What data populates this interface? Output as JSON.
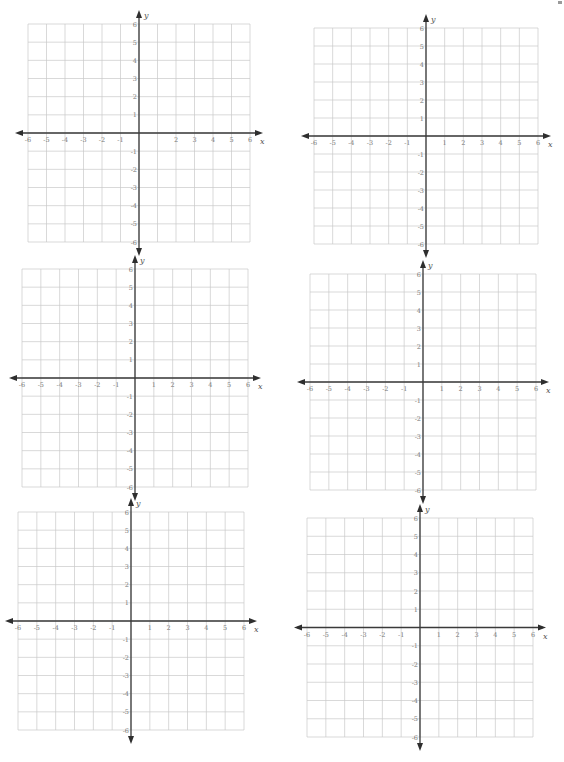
{
  "page": {
    "background": "#ffffff",
    "grid_color": "#c9c9c9",
    "axis_color": "#3a3a3a",
    "label_color": "#7a7a7a"
  },
  "planes": [
    {
      "id": "plane-1",
      "position": "top-left",
      "grid_box": {
        "left": 28,
        "top": 24,
        "width": 222,
        "height": 218
      },
      "x_axis_label": "x",
      "y_axis_label": "y",
      "x_range": [
        -6,
        6
      ],
      "y_range": [
        -6,
        6
      ],
      "x_tick_labels": [
        "-6",
        "-5",
        "-4",
        "-3",
        "-2",
        "-1",
        "",
        "2",
        "3",
        "4",
        "5",
        "6"
      ],
      "y_tick_labels": [
        "6",
        "5",
        "4",
        "3",
        "2",
        "1",
        "-1",
        "-2",
        "-3",
        "-4",
        "-5",
        "-6"
      ]
    },
    {
      "id": "plane-2",
      "position": "top-right",
      "grid_box": {
        "left": 314,
        "top": 28,
        "width": 224,
        "height": 216
      },
      "x_axis_label": "x",
      "y_axis_label": "y",
      "x_range": [
        -6,
        6
      ],
      "y_range": [
        -6,
        6
      ],
      "x_tick_labels": [
        "-6",
        "-5",
        "-4",
        "-3",
        "-2",
        "-1",
        "1",
        "2",
        "3",
        "4",
        "5",
        "6"
      ],
      "y_tick_labels": [
        "6",
        "5",
        "4",
        "3",
        "2",
        "1",
        "-1",
        "-2",
        "-3",
        "-4",
        "-5",
        "-6"
      ]
    },
    {
      "id": "plane-3",
      "position": "middle-left",
      "grid_box": {
        "left": 22,
        "top": 269,
        "width": 226,
        "height": 218
      },
      "x_axis_label": "x",
      "y_axis_label": "y",
      "x_range": [
        -6,
        6
      ],
      "y_range": [
        -6,
        6
      ],
      "x_tick_labels": [
        "-6",
        "-5",
        "-4",
        "-3",
        "-2",
        "-1",
        "1",
        "2",
        "3",
        "4",
        "5",
        "6"
      ],
      "y_tick_labels": [
        "6",
        "5",
        "4",
        "3",
        "2",
        "1",
        "-1",
        "-2",
        "-3",
        "-4",
        "-5",
        "-6"
      ]
    },
    {
      "id": "plane-4",
      "position": "middle-right",
      "grid_box": {
        "left": 310,
        "top": 274,
        "width": 226,
        "height": 216
      },
      "x_axis_label": "x",
      "y_axis_label": "y",
      "x_range": [
        -6,
        6
      ],
      "y_range": [
        -6,
        6
      ],
      "x_tick_labels": [
        "-6",
        "-5",
        "-4",
        "-3",
        "-2",
        "-1",
        "1",
        "2",
        "3",
        "4",
        "5",
        "6"
      ],
      "y_tick_labels": [
        "6",
        "5",
        "4",
        "3",
        "2",
        "1",
        "-1",
        "-2",
        "-3",
        "-4",
        "-5",
        "-6"
      ]
    },
    {
      "id": "plane-5",
      "position": "bottom-left",
      "grid_box": {
        "left": 18,
        "top": 512,
        "width": 226,
        "height": 218
      },
      "x_axis_label": "x",
      "y_axis_label": "y",
      "x_range": [
        -6,
        6
      ],
      "y_range": [
        -6,
        6
      ],
      "x_tick_labels": [
        "-6",
        "-5",
        "-4",
        "-3",
        "-2",
        "-1",
        "1",
        "2",
        "3",
        "4",
        "5",
        "6"
      ],
      "y_tick_labels": [
        "6",
        "5",
        "4",
        "3",
        "2",
        "1",
        "-1",
        "-2",
        "-3",
        "-4",
        "-5",
        "-6"
      ]
    },
    {
      "id": "plane-6",
      "position": "bottom-right",
      "grid_box": {
        "left": 307,
        "top": 518,
        "width": 226,
        "height": 219
      },
      "x_axis_label": "x",
      "y_axis_label": "y",
      "x_range": [
        -6,
        6
      ],
      "y_range": [
        -6,
        6
      ],
      "x_tick_labels": [
        "-6",
        "-5",
        "-4",
        "-3",
        "-2",
        "-1",
        "1",
        "2",
        "3",
        "4",
        "5",
        "6"
      ],
      "y_tick_labels": [
        "6",
        "5",
        "4",
        "3",
        "2",
        "1",
        "-1",
        "-2",
        "-3",
        "-4",
        "-5",
        "-6"
      ]
    }
  ]
}
